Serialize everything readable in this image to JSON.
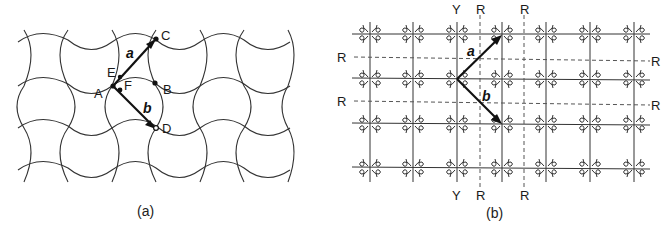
{
  "panels": [
    {
      "id": "a",
      "caption": "(a)",
      "description": "Periodic tiling of curved (concave/convex) tiles with two lattice vectors",
      "points": {
        "A": "A",
        "B": "B",
        "C": "C",
        "D": "D",
        "E": "E",
        "F": "F"
      },
      "vectors": {
        "a": "a",
        "b": "b"
      },
      "colors": {
        "line": "#333333",
        "vector": "#111111",
        "background": "#ffffff"
      }
    },
    {
      "id": "b",
      "caption": "(b)",
      "description": "Rectangular lattice with asymmetric motifs; solid mirror lines and dashed glide lines",
      "vectors": {
        "a": "a",
        "b": "b"
      },
      "axis_labels": {
        "top": [
          "Y",
          "R",
          "R"
        ],
        "bottom": [
          "Y",
          "R",
          "R"
        ],
        "left": [
          "R",
          "R"
        ],
        "right": [
          "R",
          "R"
        ]
      },
      "colors": {
        "line": "#333333",
        "dashed": "#555555",
        "vector": "#111111"
      }
    }
  ]
}
